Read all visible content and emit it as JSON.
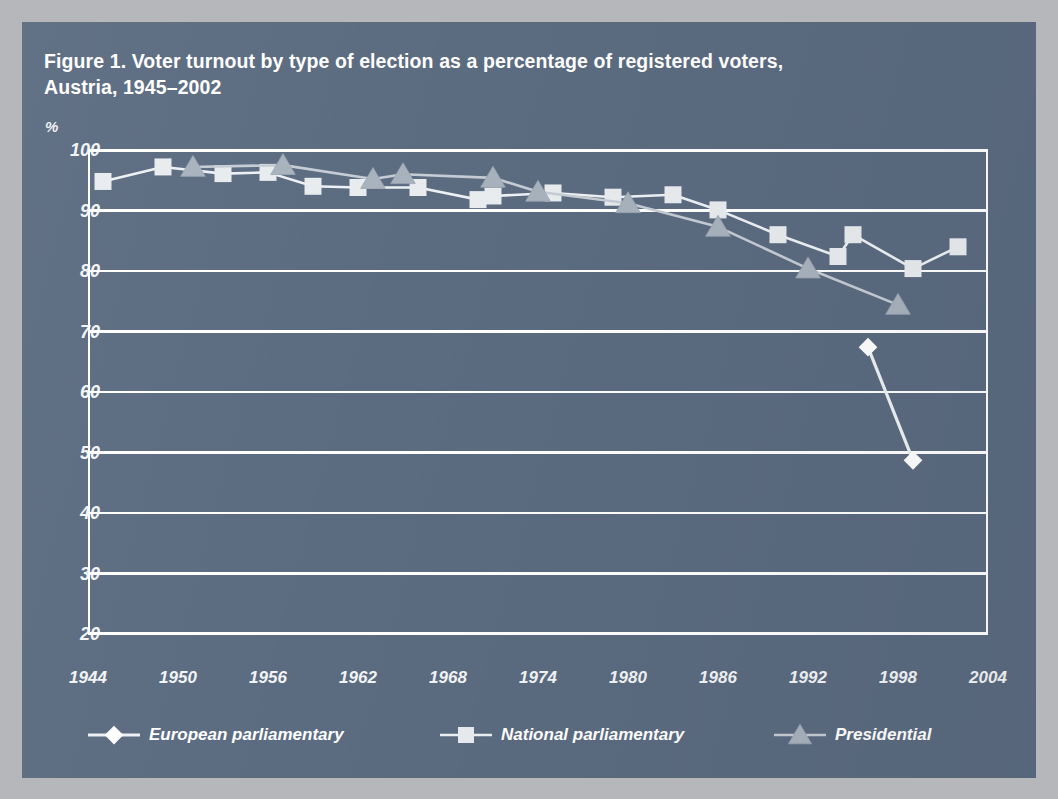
{
  "figure": {
    "title_line1": "Figure 1. Voter turnout by type of election as a percentage of registered voters,",
    "title_line2": "Austria, 1945–2002",
    "unit_label": "%",
    "panel_color": "#5b6b80",
    "page_color": "#b5b7ba"
  },
  "chart_data": {
    "type": "line",
    "title": "Figure 1. Voter turnout by type of election as a percentage of registered voters, Austria, 1945–2002",
    "xlabel": "",
    "ylabel": "%",
    "xlim": [
      1944,
      2004
    ],
    "ylim": [
      20,
      100
    ],
    "ytick_labels": [
      "100",
      "90",
      "80",
      "70",
      "60",
      "50",
      "40",
      "30",
      "20"
    ],
    "yticks": [
      100,
      90,
      80,
      70,
      60,
      50,
      40,
      30,
      20
    ],
    "xtick_labels": [
      "1944",
      "1950",
      "1956",
      "1962",
      "1968",
      "1974",
      "1980",
      "1986",
      "1992",
      "1998",
      "2004"
    ],
    "xticks": [
      1944,
      1950,
      1956,
      1962,
      1968,
      1974,
      1980,
      1986,
      1992,
      1998,
      2004
    ],
    "grid": "horizontal",
    "legend_position": "bottom",
    "series": [
      {
        "name": "European parliamentary",
        "marker": "diamond",
        "color": "#ffffff",
        "x": [
          1996,
          1999
        ],
        "values": [
          67.4,
          48.7
        ]
      },
      {
        "name": "National parliamentary",
        "marker": "square",
        "color": "#e8ecef",
        "x": [
          1945,
          1949,
          1953,
          1956,
          1959,
          1962,
          1966,
          1970,
          1971,
          1975,
          1979,
          1983,
          1986,
          1990,
          1994,
          1995,
          1999,
          2002
        ],
        "values": [
          94.8,
          97.2,
          96.1,
          96.3,
          94.0,
          93.8,
          93.8,
          91.8,
          92.4,
          92.9,
          92.2,
          92.6,
          90.1,
          86.0,
          82.4,
          86.0,
          80.4,
          84.0
        ]
      },
      {
        "name": "Presidential",
        "marker": "triangle",
        "color": "#a8b2bd",
        "x": [
          1951,
          1957,
          1963,
          1965,
          1971,
          1974,
          1980,
          1986,
          1992,
          1998
        ],
        "values": [
          97.2,
          97.5,
          95.2,
          96.0,
          95.4,
          93.1,
          91.2,
          87.3,
          80.4,
          74.4
        ]
      }
    ]
  },
  "legend": {
    "items": [
      {
        "label": "European parliamentary",
        "marker": "diamond",
        "color": "#ffffff"
      },
      {
        "label": "National parliamentary",
        "marker": "square",
        "color": "#e8ecef"
      },
      {
        "label": "Presidential",
        "marker": "triangle",
        "color": "#a8b2bd"
      }
    ]
  }
}
